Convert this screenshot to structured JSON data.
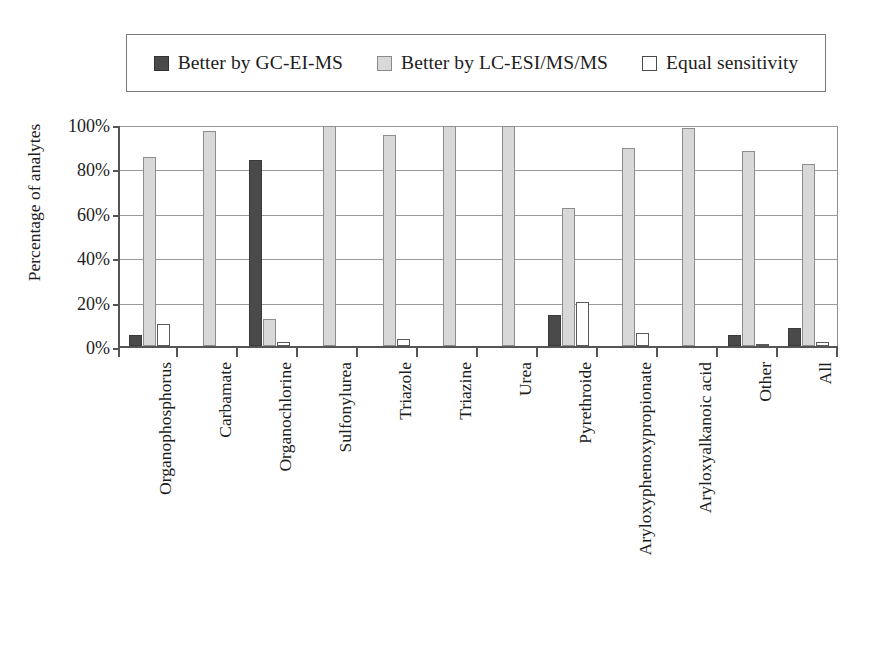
{
  "legend": {
    "entries": [
      {
        "label": "Better by GC-EI-MS",
        "swatch": "dark-swatch-icon",
        "color": "#4a4a4a"
      },
      {
        "label": "Better by LC-ESI/MS/MS",
        "swatch": "gray-swatch-icon",
        "color": "#d8d8d8"
      },
      {
        "label": "Equal sensitivity",
        "swatch": "white-swatch-icon",
        "color": "#ffffff"
      }
    ]
  },
  "chart_data": {
    "type": "bar",
    "title": "",
    "xlabel": "",
    "ylabel": "Percentage of analytes",
    "ylim": [
      0,
      100
    ],
    "ytick_labels": [
      "100%",
      "80%",
      "60%",
      "40%",
      "20%",
      "0%"
    ],
    "ytick_values": [
      100,
      80,
      60,
      40,
      20,
      0
    ],
    "grid": true,
    "legend_position": "top",
    "categories": [
      "Organophosphorus",
      "Carbamate",
      "Organochlorine",
      "Sulfonylurea",
      "Triazole",
      "Triazine",
      "Urea",
      "Pyrethroide",
      "Aryloxyphenoxypropionate",
      "Aryloxyalkanoic acid",
      "Other",
      "All"
    ],
    "series": [
      {
        "name": "Better by GC-EI-MS",
        "color": "#4a4a4a",
        "values": [
          5,
          0,
          84,
          0,
          0,
          0,
          0,
          14,
          0,
          0,
          5,
          8
        ]
      },
      {
        "name": "Better by LC-ESI/MS/MS",
        "color": "#d8d8d8",
        "values": [
          85,
          97,
          12,
          99,
          95,
          99,
          99,
          62,
          89,
          98,
          88,
          82
        ]
      },
      {
        "name": "Equal sensitivity",
        "color": "#ffffff",
        "values": [
          10,
          0,
          2,
          0,
          3,
          0,
          0,
          20,
          6,
          0,
          1,
          2
        ]
      }
    ]
  }
}
